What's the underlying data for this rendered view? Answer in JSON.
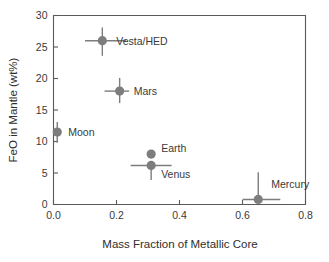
{
  "chart_data": {
    "type": "scatter",
    "title": "",
    "xlabel": "Mass Fraction of Metallic Core",
    "ylabel": "FeO in Mantle (wt%)",
    "xlim": [
      0.0,
      0.8
    ],
    "ylim": [
      0,
      30
    ],
    "grid": false,
    "legend": "none",
    "xticks": [
      "0.0",
      "0.2",
      "0.4",
      "0.6",
      "0.8"
    ],
    "xtick_values": [
      0.0,
      0.2,
      0.4,
      0.6,
      0.8
    ],
    "yticks": [
      "0",
      "5",
      "10",
      "15",
      "20",
      "25",
      "30"
    ],
    "ytick_values": [
      0,
      5,
      10,
      15,
      20,
      25,
      30
    ],
    "marker_color": "#7d7d7d",
    "errorbar_color": "#7d7d7d",
    "axis_color": "#5a5a5a",
    "points": [
      {
        "label": "Vesta/HED",
        "x": 0.155,
        "y": 26.0,
        "xerr_low": 0.055,
        "xerr_high": 0.075,
        "yerr_low": 2.4,
        "yerr_high": 2.1,
        "label_dx": 14,
        "label_dy": 4
      },
      {
        "label": "Mars",
        "x": 0.21,
        "y": 18.0,
        "xerr_low": 0.048,
        "xerr_high": 0.03,
        "yerr_low": 1.9,
        "yerr_high": 2.1,
        "label_dx": 14,
        "label_dy": 4
      },
      {
        "label": "Moon",
        "x": 0.012,
        "y": 11.5,
        "xerr_low": 0.0,
        "xerr_high": 0.0,
        "yerr_low": 1.7,
        "yerr_high": 1.6,
        "label_dx": 11,
        "label_dy": 4
      },
      {
        "label": "Earth",
        "x": 0.31,
        "y": 8.0,
        "xerr_low": 0.0,
        "xerr_high": 0.0,
        "yerr_low": 0.0,
        "yerr_high": 0.0,
        "label_dx": 10,
        "label_dy": -2
      },
      {
        "label": "Venus",
        "x": 0.31,
        "y": 6.2,
        "xerr_low": 0.065,
        "xerr_high": 0.065,
        "yerr_low": 2.3,
        "yerr_high": 0.0,
        "label_dx": 10,
        "label_dy": 13
      },
      {
        "label": "Mercury",
        "x": 0.65,
        "y": 0.8,
        "xerr_low": 0.05,
        "xerr_high": 0.07,
        "yerr_low": 0.0,
        "yerr_high": 4.3,
        "label_dx": 13,
        "label_dy": -11
      }
    ]
  }
}
